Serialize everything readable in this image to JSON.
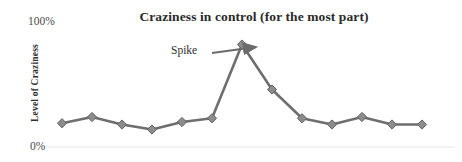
{
  "chart_data": {
    "type": "line",
    "title": "Craziness in control (for the most part)",
    "xlabel": "",
    "ylabel": "Level of Craziness",
    "ylim": [
      0,
      100
    ],
    "ytick_labels": [
      "100%",
      "0%"
    ],
    "ytick_values": [
      100,
      0
    ],
    "grid": false,
    "legend": "none",
    "x": [
      1,
      2,
      3,
      4,
      5,
      6,
      7,
      8,
      9,
      10,
      11,
      12,
      13
    ],
    "categories": [
      "1",
      "2",
      "3",
      "4",
      "5",
      "6",
      "7",
      "8",
      "9",
      "10",
      "11",
      "12",
      "13"
    ],
    "series": [
      {
        "name": "Level of Craziness",
        "values": [
          19,
          24,
          18,
          14,
          20,
          23,
          82,
          46,
          23,
          18,
          24,
          18,
          18
        ],
        "color": "#6e6e6e",
        "marker": "diamond",
        "marker_color": "#8c8c8c"
      }
    ],
    "annotations": [
      {
        "text": "Spike",
        "points_to_index": 6,
        "points_to_value": 82,
        "arrow": "right"
      }
    ]
  },
  "colors": {
    "line": "#6e6e6e",
    "marker_fill": "#8c8c8c",
    "marker_stroke": "#5f5f5f",
    "axis_line": "#e3e3e3",
    "title_text": "#2a2a2a",
    "tick_text": "#4a4a4a",
    "annotation_text": "#2f2f2f",
    "arrow": "#6b6b6b",
    "background": "#ffffff"
  },
  "axis": {
    "y_top_label": "100%",
    "y_bottom_label": "0%",
    "y_title": "Level of Craziness"
  },
  "annotation": {
    "spike_label": "Spike"
  }
}
